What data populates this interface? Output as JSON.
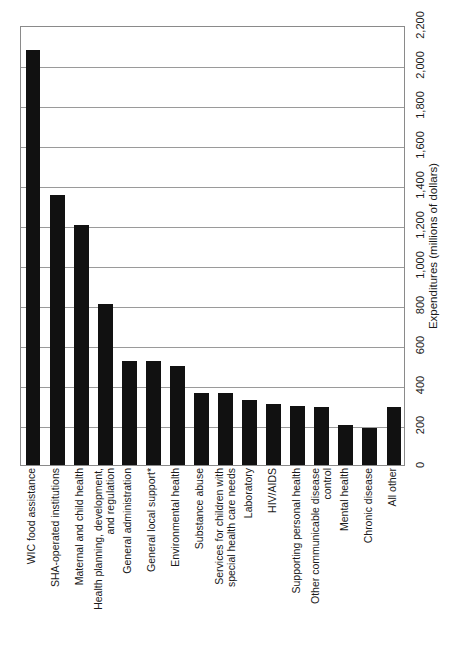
{
  "chart_data": {
    "type": "bar",
    "title": "",
    "orientation": "vertical-bars-rotated-page",
    "xlabel": "",
    "ylabel": "Expenditures (millions of dollars)",
    "ylim": [
      0,
      2200
    ],
    "ytick_step": 200,
    "grid": true,
    "legend": "none",
    "bar_color": "#111111",
    "categories": [
      "WIC food assistance",
      "SHA-operated institutions",
      "Maternal and child health",
      "Health planning, development, and regulation",
      "General administration",
      "General local support*",
      "Environmental health",
      "Substance abuse",
      "Services for children with special health care needs",
      "Laboratory",
      "HIV/AIDS",
      "Supporting personal health",
      "Other communicable disease control",
      "Mental health",
      "Chronic disease",
      "All other"
    ],
    "category_lines": [
      [
        "WIC food assistance"
      ],
      [
        "SHA-operated institutions"
      ],
      [
        "Maternal and child health"
      ],
      [
        "Health planning, development,",
        "and regulation"
      ],
      [
        "General administration"
      ],
      [
        "General local support*"
      ],
      [
        "Environmental health"
      ],
      [
        "Substance abuse"
      ],
      [
        "Services for children with",
        "special health care needs"
      ],
      [
        "Laboratory"
      ],
      [
        "HIV/AIDS"
      ],
      [
        "Supporting personal health"
      ],
      [
        "Other communicable disease",
        "control"
      ],
      [
        "Mental health"
      ],
      [
        "Chronic disease"
      ],
      [
        "All other"
      ]
    ],
    "values": [
      2075,
      1350,
      1200,
      805,
      520,
      520,
      495,
      360,
      360,
      325,
      305,
      295,
      290,
      200,
      185,
      290
    ],
    "ytick_labels": [
      "0",
      "200",
      "400",
      "600",
      "800",
      "1,000",
      "1,200",
      "1,400",
      "1,600",
      "1,800",
      "2,000",
      "2,200"
    ],
    "ytick_values": [
      0,
      200,
      400,
      600,
      800,
      1000,
      1200,
      1400,
      1600,
      1800,
      2000,
      2200
    ],
    "footnote_marker": "*"
  },
  "axis": {
    "value_axis_title": "Expenditures (millions of dollars)"
  }
}
